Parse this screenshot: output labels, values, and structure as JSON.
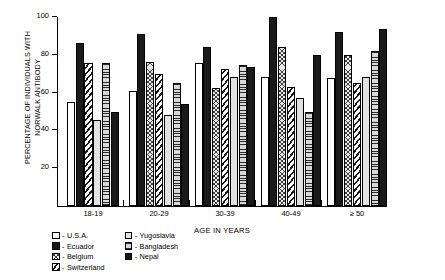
{
  "chart_data": {
    "type": "bar",
    "title": "",
    "xlabel": "AGE IN YEARS",
    "ylabel": "PERCENTAGE OF INDIVIDUALS WITH\nNORWALK ANTIBODY",
    "ylim": [
      0,
      100
    ],
    "yticks": [
      20,
      40,
      60,
      80,
      100
    ],
    "ytick_labels": [
      "20",
      "40",
      "60",
      "80",
      "100"
    ],
    "grid": false,
    "legend_position": "below-left",
    "categories": [
      "18-19",
      "20-29",
      "30-39",
      "40-49",
      "≥ 50"
    ],
    "series": [
      {
        "name": "U.S.A.",
        "pattern": "open-white",
        "values": [
          55,
          61,
          75.5,
          68,
          67.5
        ]
      },
      {
        "name": "Ecuador",
        "pattern": "solid-black",
        "values": [
          86,
          91,
          84,
          100,
          92
        ]
      },
      {
        "name": "Belgium",
        "pattern": "cross-hatch",
        "values": [
          null,
          76,
          62.5,
          84,
          80
        ]
      },
      {
        "name": "Switzerland",
        "pattern": "diagonal-hatch",
        "values": [
          75.5,
          70,
          72.5,
          63,
          65
        ]
      },
      {
        "name": "Yugoslavia",
        "pattern": "light-gray",
        "values": [
          45.5,
          48,
          68.5,
          57,
          68
        ]
      },
      {
        "name": "Bangladesh",
        "pattern": "horizontal-lines",
        "values": [
          75.5,
          65,
          74.5,
          50,
          82
        ]
      },
      {
        "name": "Nepal",
        "pattern": "solid-black",
        "values": [
          50,
          54,
          73.5,
          80,
          93.5
        ]
      }
    ]
  },
  "legend": {
    "dash": "-",
    "columns": [
      [
        {
          "label": "U.S.A.",
          "pattern": "open-white"
        },
        {
          "label": "Ecuador",
          "pattern": "solid-black"
        },
        {
          "label": "Belgium",
          "pattern": "cross-hatch"
        },
        {
          "label": "Switzerland",
          "pattern": "diagonal-hatch"
        }
      ],
      [
        {
          "label": "Yugoslavia",
          "pattern": "light-gray"
        },
        {
          "label": "Bangladesh",
          "pattern": "horizontal-lines"
        },
        {
          "label": "Nepal",
          "pattern": "solid-black"
        }
      ]
    ]
  }
}
